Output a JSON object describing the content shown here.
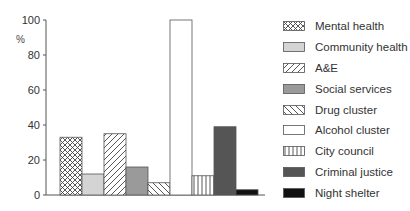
{
  "chart_data": {
    "type": "bar",
    "title": "",
    "xlabel": "",
    "ylabel": "%",
    "ylim": [
      0,
      100
    ],
    "yticks": [
      0,
      20,
      40,
      60,
      80,
      100
    ],
    "grid": false,
    "legend_position": "right",
    "categories": [
      "Mental health",
      "Community health",
      "A&E",
      "Social services",
      "Drug cluster",
      "Alcohol cluster",
      "City council",
      "Criminal justice",
      "Night shelter"
    ],
    "values": [
      33,
      12,
      35,
      16,
      7,
      100,
      11,
      39,
      3
    ],
    "patterns": [
      "crosshatch",
      "light-gray",
      "diagonal-forward",
      "mid-gray",
      "diagonal-back",
      "white",
      "vertical-lines",
      "dark-gray",
      "black"
    ]
  },
  "legend": {
    "items": [
      {
        "label": "Mental health"
      },
      {
        "label": "Community health"
      },
      {
        "label": "A&E"
      },
      {
        "label": "Social services"
      },
      {
        "label": "Drug cluster"
      },
      {
        "label": "Alcohol cluster"
      },
      {
        "label": "City council"
      },
      {
        "label": "Criminal justice"
      },
      {
        "label": "Night shelter"
      }
    ]
  },
  "colors": {
    "axis": "#555555",
    "light_gray": "#d4d4d4",
    "mid_gray": "#9a9a9a",
    "dark_gray": "#555555",
    "black": "#111111"
  }
}
